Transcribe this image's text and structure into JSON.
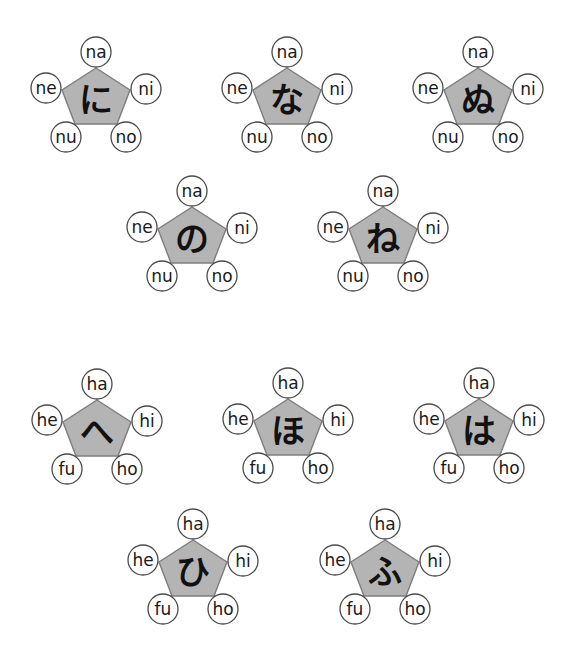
{
  "groups": [
    {
      "id": "ni",
      "kana": "に",
      "cx": 96,
      "cy": 52,
      "labels": {
        "top": "na",
        "left": "ne",
        "right": "ni",
        "bottom_left": "nu",
        "bottom_right": "no"
      }
    },
    {
      "id": "na",
      "kana": "な",
      "cx": 287,
      "cy": 52,
      "labels": {
        "top": "na",
        "left": "ne",
        "right": "ni",
        "bottom_left": "nu",
        "bottom_right": "no"
      }
    },
    {
      "id": "nu",
      "kana": "ぬ",
      "cx": 478,
      "cy": 52,
      "labels": {
        "top": "na",
        "left": "ne",
        "right": "ni",
        "bottom_left": "nu",
        "bottom_right": "no"
      }
    },
    {
      "id": "no",
      "kana": "の",
      "cx": 192,
      "cy": 191,
      "labels": {
        "top": "na",
        "left": "ne",
        "right": "ni",
        "bottom_left": "nu",
        "bottom_right": "no"
      }
    },
    {
      "id": "ne",
      "kana": "ね",
      "cx": 383,
      "cy": 191,
      "labels": {
        "top": "na",
        "left": "ne",
        "right": "ni",
        "bottom_left": "nu",
        "bottom_right": "no"
      }
    },
    {
      "id": "he",
      "kana": "へ",
      "cx": 97,
      "cy": 384,
      "labels": {
        "top": "ha",
        "left": "he",
        "right": "hi",
        "bottom_left": "fu",
        "bottom_right": "ho"
      }
    },
    {
      "id": "ho",
      "kana": "ほ",
      "cx": 288,
      "cy": 383,
      "labels": {
        "top": "ha",
        "left": "he",
        "right": "hi",
        "bottom_left": "fu",
        "bottom_right": "ho"
      }
    },
    {
      "id": "ha",
      "kana": "は",
      "cx": 479,
      "cy": 383,
      "labels": {
        "top": "ha",
        "left": "he",
        "right": "hi",
        "bottom_left": "fu",
        "bottom_right": "ho"
      }
    },
    {
      "id": "hi",
      "kana": "ひ",
      "cx": 193,
      "cy": 524,
      "labels": {
        "top": "ha",
        "left": "he",
        "right": "hi",
        "bottom_left": "fu",
        "bottom_right": "ho"
      }
    },
    {
      "id": "fu",
      "kana": "ふ",
      "cx": 385,
      "cy": 524,
      "labels": {
        "top": "ha",
        "left": "he",
        "right": "hi",
        "bottom_left": "fu",
        "bottom_right": "ho"
      }
    }
  ],
  "colors": {
    "pentagon_fill": "#b4b4b4",
    "pentagon_stroke": "#7d7d7d",
    "circle_fill": "#ffffff",
    "circle_stroke": "#4a4a4a",
    "text": "#111111"
  }
}
